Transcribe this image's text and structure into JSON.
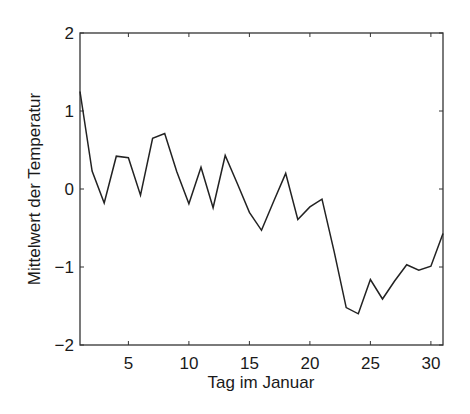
{
  "chart_data": {
    "type": "line",
    "title": "",
    "xlabel": "Tag im Januar",
    "ylabel": "Mittelwert der Temperatur",
    "xlim": [
      1,
      31
    ],
    "ylim": [
      -2,
      2
    ],
    "xticks": [
      5,
      10,
      15,
      20,
      25,
      30
    ],
    "yticks": [
      -2,
      -1,
      0,
      1,
      2
    ],
    "xtick_labels": [
      "5",
      "10",
      "15",
      "20",
      "25",
      "30"
    ],
    "ytick_labels": [
      "−2",
      "−1",
      "0",
      "1",
      "2"
    ],
    "grid": false,
    "legend": null,
    "x": [
      1,
      2,
      3,
      4,
      5,
      6,
      7,
      8,
      9,
      10,
      11,
      12,
      13,
      14,
      15,
      16,
      17,
      18,
      19,
      20,
      21,
      22,
      23,
      24,
      25,
      26,
      27,
      28,
      29,
      30,
      31
    ],
    "series": [
      {
        "name": "Mittelwert der Temperatur",
        "color": "#222222",
        "values": [
          1.25,
          0.23,
          -0.18,
          0.42,
          0.4,
          -0.08,
          0.65,
          0.71,
          0.22,
          -0.19,
          0.28,
          -0.24,
          0.43,
          0.07,
          -0.3,
          -0.53,
          -0.16,
          0.2,
          -0.39,
          -0.23,
          -0.13,
          -0.8,
          -1.52,
          -1.6,
          -1.16,
          -1.41,
          -1.18,
          -0.97,
          -1.04,
          -0.99,
          -0.57
        ]
      }
    ]
  }
}
